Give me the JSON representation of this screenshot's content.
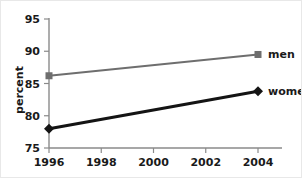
{
  "chart_data": {
    "type": "line",
    "title": "",
    "xlabel": "",
    "ylabel": "percent",
    "x": [
      1996,
      2004
    ],
    "xtick_labels": [
      "1996",
      "1998",
      "2000",
      "2002",
      "2004"
    ],
    "xticks": [
      1996,
      1998,
      2000,
      2002,
      2004
    ],
    "xlim": [
      1996,
      2004
    ],
    "ytick_labels": [
      "75",
      "80",
      "85",
      "90",
      "95"
    ],
    "yticks": [
      75,
      80,
      85,
      90,
      95
    ],
    "ylim": [
      75,
      95
    ],
    "grid": false,
    "legend_position": "right-inline-end-of-line",
    "series": [
      {
        "name": "men",
        "values": [
          86.2,
          89.5
        ],
        "color": "#6e6e6e",
        "marker": "square",
        "line_width": 2.2
      },
      {
        "name": "women",
        "values": [
          78.0,
          83.8
        ],
        "color": "#141414",
        "marker": "diamond",
        "line_width": 3.0
      }
    ]
  },
  "axis": {
    "y_title": "percent",
    "y_tick_0": "75",
    "y_tick_1": "80",
    "y_tick_2": "85",
    "y_tick_3": "90",
    "y_tick_4": "95",
    "x_tick_0": "1996",
    "x_tick_1": "1998",
    "x_tick_2": "2000",
    "x_tick_3": "2002",
    "x_tick_4": "2004"
  },
  "legend": {
    "men_label": "men",
    "women_label": "women"
  }
}
